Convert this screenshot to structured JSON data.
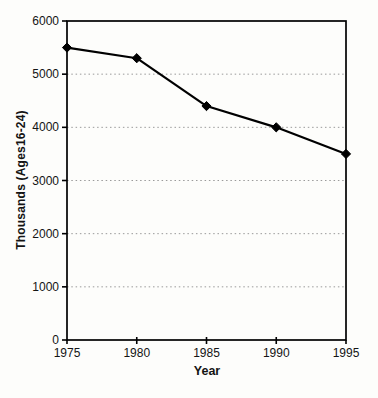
{
  "chart_data": {
    "type": "line",
    "x": [
      1975,
      1980,
      1985,
      1990,
      1995
    ],
    "values": [
      5500,
      5300,
      4400,
      4000,
      3500
    ],
    "title": "",
    "xlabel": "Year",
    "ylabel": "Thousands (Ages16-24)",
    "xlim": [
      1975,
      1995
    ],
    "ylim": [
      0,
      6000
    ],
    "xticks": [
      1975,
      1980,
      1985,
      1990,
      1995
    ],
    "yticks": [
      0,
      1000,
      2000,
      3000,
      4000,
      5000,
      6000
    ],
    "grid": "horizontal-dotted",
    "legend_position": "none",
    "marker": "diamond",
    "line_color": "#000000",
    "grid_color": "#9a9a9a",
    "frame": true
  }
}
